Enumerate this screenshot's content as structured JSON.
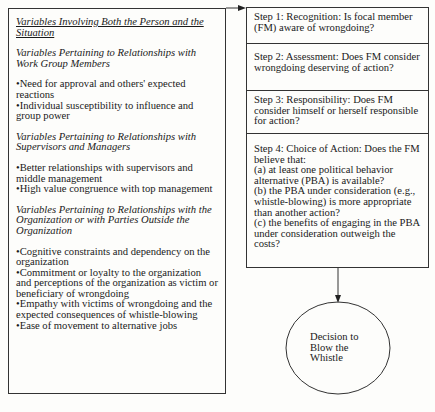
{
  "left_box": {
    "heading": "Variables Involving Both the Person and the Situation",
    "sections": [
      {
        "title": "Variables Pertaining to Relationships with Work Group Members",
        "items": [
          "Need for approval and others' expected reactions",
          "Individual susceptibility to influence and group power"
        ]
      },
      {
        "title": "Variables Pertaining to Relationships with Supervisors and Managers",
        "items": [
          "Better relationships with supervisors and middle management",
          "High value congruence with top management"
        ]
      },
      {
        "title": "Variables Pertaining to Relationships with the Organization or with Parties Outside the Organization",
        "items": [
          "Cognitive constraints and dependency on the organization",
          "Commitment or loyalty to the organization and perceptions of the organization as victim or beneficiary of wrongdoing",
          "Empathy with victims of wrongdoing and the expected consequences of whistle-blowing",
          "Ease of movement to alternative jobs"
        ]
      }
    ]
  },
  "steps": [
    {
      "text": "Step 1:  Recognition:  Is focal member (FM) aware of wrongdoing?"
    },
    {
      "text": "Step 2:  Assessment:  Does FM consider wrongdoing deserving of action?"
    },
    {
      "text": "Step 3:  Responsibility:  Does FM consider himself or herself responsible for action?"
    },
    {
      "intro": "Step 4:  Choice of Action:  Does the FM believe that:",
      "a": "(a) at least one political behavior alternative (PBA) is available?",
      "b": "(b) the PBA under consideration (e.g., whistle-blowing) is more appropriate than another action?",
      "c": "(c) the benefits of engaging in the PBA under consideration outweigh the costs?"
    }
  ],
  "decision": {
    "label": "Decision to Blow the Whistle"
  },
  "colors": {
    "line": "#333333",
    "background": "#fdfdfb",
    "text": "#1a1a1a"
  }
}
